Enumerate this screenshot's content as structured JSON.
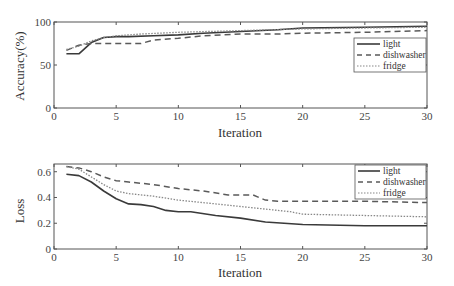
{
  "chart_data": [
    {
      "type": "line",
      "title": "",
      "xlabel": "Iteration",
      "ylabel": "Accuracy(%)",
      "xlim": [
        0,
        30
      ],
      "ylim": [
        0,
        100
      ],
      "xticks": [
        0,
        5,
        10,
        15,
        20,
        25,
        30
      ],
      "yticks": [
        0,
        50,
        100
      ],
      "grid": false,
      "legend_position": "right-middle",
      "series": [
        {
          "name": "light",
          "style": "solid",
          "x": [
            1,
            2,
            3,
            4,
            5,
            6,
            8,
            10,
            12,
            15,
            18,
            20,
            25,
            30
          ],
          "values": [
            63,
            63,
            76,
            82,
            83,
            83,
            84,
            85,
            87,
            89,
            91,
            93,
            94,
            95
          ]
        },
        {
          "name": "dishwasher",
          "style": "dashed",
          "x": [
            1,
            2,
            3,
            4,
            5,
            7,
            8,
            10,
            12,
            15,
            18,
            20,
            25,
            30
          ],
          "values": [
            67,
            73,
            75,
            75,
            75,
            75,
            79,
            81,
            84,
            86,
            86,
            87,
            88,
            90
          ]
        },
        {
          "name": "fridge",
          "style": "dotted",
          "x": [
            1,
            2,
            3,
            4,
            5,
            7,
            10,
            15,
            20,
            25,
            30
          ],
          "values": [
            68,
            72,
            78,
            82,
            84,
            86,
            88,
            90,
            92,
            93,
            94
          ]
        }
      ]
    },
    {
      "type": "line",
      "title": "",
      "xlabel": "Iteration",
      "ylabel": "Loss",
      "xlim": [
        0,
        30
      ],
      "ylim": [
        0,
        0.66
      ],
      "xticks": [
        0,
        5,
        10,
        15,
        20,
        25,
        30
      ],
      "yticks": [
        0,
        0.2,
        0.4,
        0.6
      ],
      "grid": false,
      "legend_position": "upper-right",
      "series": [
        {
          "name": "light",
          "style": "solid",
          "x": [
            1,
            2,
            3,
            4,
            5,
            6,
            7,
            8,
            9,
            10,
            11,
            13,
            15,
            17,
            20,
            25,
            30
          ],
          "values": [
            0.58,
            0.57,
            0.52,
            0.45,
            0.39,
            0.35,
            0.345,
            0.33,
            0.3,
            0.29,
            0.29,
            0.26,
            0.24,
            0.21,
            0.19,
            0.18,
            0.18
          ]
        },
        {
          "name": "dishwasher",
          "style": "dashed",
          "x": [
            1,
            2,
            3,
            4,
            5,
            6,
            8,
            10,
            12,
            14,
            16,
            17,
            18,
            20,
            25,
            30
          ],
          "values": [
            0.64,
            0.63,
            0.6,
            0.56,
            0.53,
            0.52,
            0.5,
            0.47,
            0.45,
            0.42,
            0.42,
            0.38,
            0.37,
            0.37,
            0.37,
            0.36
          ]
        },
        {
          "name": "fridge",
          "style": "dotted",
          "x": [
            1,
            2,
            3,
            4,
            5,
            6,
            8,
            10,
            13,
            15,
            17,
            19,
            20,
            25,
            30
          ],
          "values": [
            0.64,
            0.62,
            0.56,
            0.5,
            0.45,
            0.43,
            0.41,
            0.38,
            0.35,
            0.33,
            0.31,
            0.29,
            0.27,
            0.26,
            0.25
          ]
        }
      ]
    }
  ],
  "charts": {
    "top": {
      "ylabel": "Accuracy(%)",
      "xlabel": "Iteration",
      "yticks": [
        "0",
        "50",
        "100"
      ],
      "xticks": [
        "0",
        "5",
        "10",
        "15",
        "20",
        "25",
        "30"
      ],
      "legend": [
        "light",
        "dishwasher",
        "fridge"
      ]
    },
    "bottom": {
      "ylabel": "Loss",
      "xlabel": "Iteration",
      "yticks": [
        "0",
        "0.2",
        "0.4",
        "0.6"
      ],
      "xticks": [
        "0",
        "5",
        "10",
        "15",
        "20",
        "25",
        "30"
      ],
      "legend": [
        "light",
        "dishwasher",
        "fridge"
      ]
    }
  },
  "colors": {
    "axis": "#555555",
    "light": "#3a3a3a",
    "dishwasher": "#5a5a5a",
    "fridge": "#888888"
  }
}
